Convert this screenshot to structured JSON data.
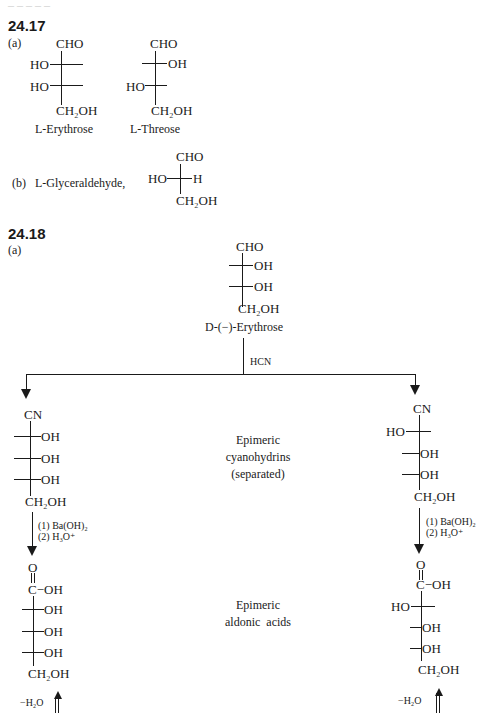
{
  "top_cut": "_ _ _ _ _",
  "sec2417": {
    "number": "24.17",
    "part_a": "(a)",
    "erythrose": {
      "top": "CHO",
      "row1_left": "HO",
      "row2_left": "HO",
      "bottom": "CH₂OH",
      "name": "L-Erythrose"
    },
    "threose": {
      "top": "CHO",
      "row1_right": "OH",
      "row2_left": "HO",
      "bottom": "CH₂OH",
      "name": "L-Threose"
    },
    "part_b": "(b)",
    "glyceraldehyde_label": "L-Glyceraldehyde,",
    "glyceraldehyde": {
      "top": "CHO",
      "left": "HO",
      "right": "H",
      "bottom": "CH₂OH"
    }
  },
  "sec2418": {
    "number": "24.18",
    "part_a": "(a)",
    "start": {
      "top": "CHO",
      "row1_right": "OH",
      "row2_right": "OH",
      "bottom": "CH₂OH",
      "name": "D-(−)-Erythrose"
    },
    "reagent_hcn": "HCN",
    "cyano_left": {
      "top": "CN",
      "r1": "OH",
      "r2": "OH",
      "r3": "OH",
      "bottom": "CH₂OH"
    },
    "cyano_right": {
      "top": "CN",
      "r1_left": "HO",
      "r2": "OH",
      "r3": "OH",
      "bottom": "CH₂OH"
    },
    "cyano_caption": [
      "Epimeric",
      "cyanohydrins",
      "(separated)"
    ],
    "step_reagents": [
      "(1)  Ba(OH)₂",
      "(2)  H₃O⁺"
    ],
    "acid_left": {
      "carbonyl_o": "O",
      "carbonyl": "C−OH",
      "r1": "OH",
      "r2": "OH",
      "r3": "OH",
      "bottom": "CH₂OH"
    },
    "acid_right": {
      "carbonyl_o": "O",
      "carbonyl": "C−OH",
      "r1_left": "HO",
      "r2": "OH",
      "r3": "OH",
      "bottom": "CH₂OH"
    },
    "acid_caption": [
      "Epimeric",
      "aldonic  acids"
    ],
    "dehydration": "−H₂O"
  }
}
